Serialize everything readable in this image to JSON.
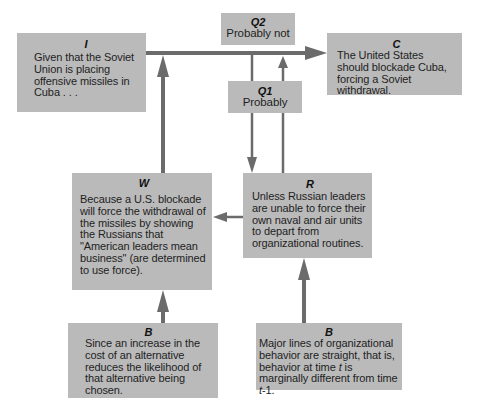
{
  "diagram": {
    "boxes": {
      "I": {
        "label": "I",
        "text": "Given that the Soviet Union is placing offensive missiles in Cuba . . ."
      },
      "Q2": {
        "label": "Q2",
        "text": "Probably not"
      },
      "C": {
        "label": "C",
        "text": "The United States should blockade Cuba, forcing a Soviet withdrawal."
      },
      "Q1": {
        "label": "Q1",
        "text": "Probably"
      },
      "W": {
        "label": "W",
        "text": "Because a U.S. blockade will force the withdrawal of the missiles by showing the Russians that \"American leaders mean business\" (are determined to use force)."
      },
      "R": {
        "label": "R",
        "text": "Unless Russian leaders are unable to force their own naval and air units to depart from organizational routines."
      },
      "B_left": {
        "label": "B",
        "text": "Since an increase in the cost of an alternative reduces the likelihood of that alternative being chosen."
      },
      "B_right": {
        "label": "B",
        "text_before_t": "Major lines of organizational behavior are straight, that is, behavior at time ",
        "t1": "t",
        "text_mid": " is marginally different from time ",
        "t2": "t",
        "text_after": "-1."
      }
    },
    "colors": {
      "box_fill": "#bababa",
      "arrow": "#6b6b6b",
      "text": "#1e1e1e"
    },
    "arrows": [
      {
        "from": "I",
        "to": "C"
      },
      {
        "from": "W",
        "to": "I-C line"
      },
      {
        "from": "I-C line",
        "to": "R",
        "via": "Q1"
      },
      {
        "from": "R",
        "to": "I-C line",
        "via": "Q1"
      },
      {
        "from": "R",
        "to": "W"
      },
      {
        "from": "B_left",
        "to": "W"
      },
      {
        "from": "B_right",
        "to": "R"
      }
    ]
  }
}
